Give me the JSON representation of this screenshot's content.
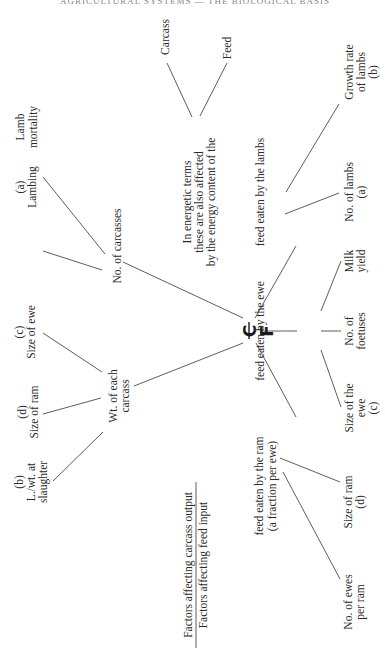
{
  "page": {
    "running_header": "AGRICULTURAL SYSTEMS — THE BIOLOGICAL BASIS"
  },
  "diagram": {
    "orientation": "rotated 90° counter-clockwise",
    "center": {
      "numerator": "C",
      "denominator": "F"
    },
    "legend": {
      "numerator": "Factors affecting carcass output",
      "denominator": "Factors affecting feed input"
    },
    "output_branch": {
      "no_carcasses": {
        "label": "No. of carcasses",
        "children": [
          {
            "lines": [
              "Lamb",
              "mortality"
            ]
          },
          {
            "lines": [
              "(a)",
              "Lambing"
            ]
          }
        ]
      },
      "wt_each_carcass": {
        "label_lines": [
          "Wt. of each",
          "carcass"
        ],
        "children": [
          {
            "lines": [
              "(c)",
              "Size of ewe"
            ]
          },
          {
            "lines": [
              "(d)",
              "Size of ram"
            ]
          },
          {
            "lines": [
              "(b)",
              "L./wt. at",
              "slaughter"
            ]
          }
        ]
      }
    },
    "energy_note": {
      "lines": [
        "In energetic terms",
        "these are also affected",
        "by the energy content of the"
      ],
      "children": [
        "Carcass",
        "Feed"
      ]
    },
    "input_branch": {
      "lambs": {
        "label": "feed eaten by the lambs",
        "children": [
          {
            "lines": [
              "Growth rate",
              "of lambs",
              "(b)"
            ]
          },
          {
            "lines": [
              "No. of lambs",
              "(a)"
            ]
          }
        ]
      },
      "ewe": {
        "label": "feed eaten by the ewe",
        "children": [
          {
            "lines": [
              "Milk",
              "yield"
            ]
          },
          {
            "lines": [
              "No. of",
              "foetuses"
            ]
          },
          {
            "lines": [
              "Size of the",
              "ewe",
              "(c)"
            ]
          }
        ]
      },
      "ram": {
        "label_lines": [
          "feed eaten by the ram",
          "(a fraction per ewe)"
        ],
        "children": [
          {
            "lines": [
              "Size of ram",
              "(d)"
            ]
          },
          {
            "lines": [
              "No. of ewes",
              "per ram"
            ]
          }
        ]
      }
    }
  }
}
